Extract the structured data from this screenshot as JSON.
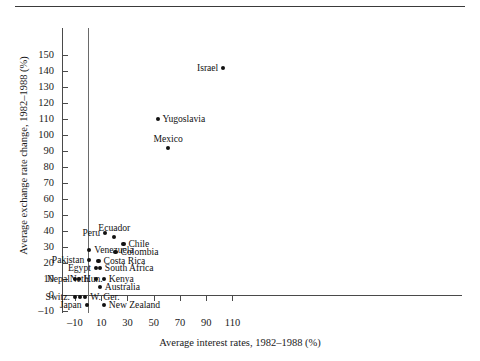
{
  "figure": {
    "has_top_rule": true,
    "background": "#ffffff",
    "marker_color": "#111111",
    "axis_color": "#4a4a4a"
  },
  "chart_data": {
    "type": "scatter",
    "title": "",
    "xlabel": "Average interest rates, 1982–1988 (%)",
    "ylabel": "Average exchange rate change, 1982–1988 (%)",
    "xlim": [
      -14,
      116
    ],
    "ylim": [
      -14,
      156
    ],
    "xticks": [
      -10,
      10,
      30,
      50,
      70,
      90,
      110
    ],
    "xtick_labels": [
      "–10",
      "10",
      "30",
      "50",
      "70",
      "90",
      "110"
    ],
    "yticks": [
      -10,
      0,
      10,
      20,
      30,
      40,
      50,
      60,
      70,
      80,
      90,
      100,
      110,
      120,
      130,
      140,
      150
    ],
    "ytick_labels": [
      "–10",
      "0",
      "10",
      "20",
      "30",
      "40",
      "50",
      "60",
      "70",
      "80",
      "90",
      "100",
      "110",
      "120",
      "130",
      "140",
      "150"
    ],
    "grid": false,
    "legend": "none",
    "reference_lines": [
      {
        "orientation": "vertical",
        "value": 0
      },
      {
        "orientation": "horizontal",
        "value": 0
      }
    ],
    "points": [
      {
        "label": "Israel",
        "x": 103,
        "y": 142,
        "label_pos": "left"
      },
      {
        "label": "Yugoslavia",
        "x": 53,
        "y": 110,
        "label_pos": "right"
      },
      {
        "label": "Mexico",
        "x": 61,
        "y": 92,
        "label_pos": "top"
      },
      {
        "label": "Peru",
        "x": 13,
        "y": 39,
        "label_pos": "left"
      },
      {
        "label": "Ecuador",
        "x": 20,
        "y": 36,
        "label_pos": "top"
      },
      {
        "label": "Chile",
        "x": 27,
        "y": 32,
        "label_pos": "right"
      },
      {
        "label": "Venezuela",
        "x": 1,
        "y": 28,
        "label_pos": "right"
      },
      {
        "label": "Colombia",
        "x": 21,
        "y": 27,
        "label_pos": "right"
      },
      {
        "label": "Pakistan",
        "x": 1,
        "y": 22,
        "label_pos": "left"
      },
      {
        "label": "Costa Rica",
        "x": 8,
        "y": 21,
        "label_pos": "right"
      },
      {
        "label": "Egypt",
        "x": 6,
        "y": 17,
        "label_pos": "left"
      },
      {
        "label": "South Africa",
        "x": 9,
        "y": 17,
        "label_pos": "right"
      },
      {
        "label": "Nepal",
        "x": -10,
        "y": 10,
        "label_pos": "left"
      },
      {
        "label": "Hun.",
        "x": -7,
        "y": 10,
        "label_pos": "right"
      },
      {
        "label": "Neth.",
        "x": 6,
        "y": 10,
        "label_pos": "left"
      },
      {
        "label": "Kenya",
        "x": 12,
        "y": 10,
        "label_pos": "right"
      },
      {
        "label": "Australia",
        "x": 9,
        "y": 5,
        "label_pos": "right"
      },
      {
        "label": "Switz.",
        "x": -10,
        "y": -1,
        "label_pos": "left"
      },
      {
        "label": "",
        "x": -6,
        "y": -1,
        "label_pos": "none"
      },
      {
        "label": "W. Ger.",
        "x": -2,
        "y": -1,
        "label_pos": "right"
      },
      {
        "label": "Japan",
        "x": -1,
        "y": -6,
        "label_pos": "left"
      },
      {
        "label": "New Zealand",
        "x": 12,
        "y": -6,
        "label_pos": "right"
      }
    ]
  }
}
